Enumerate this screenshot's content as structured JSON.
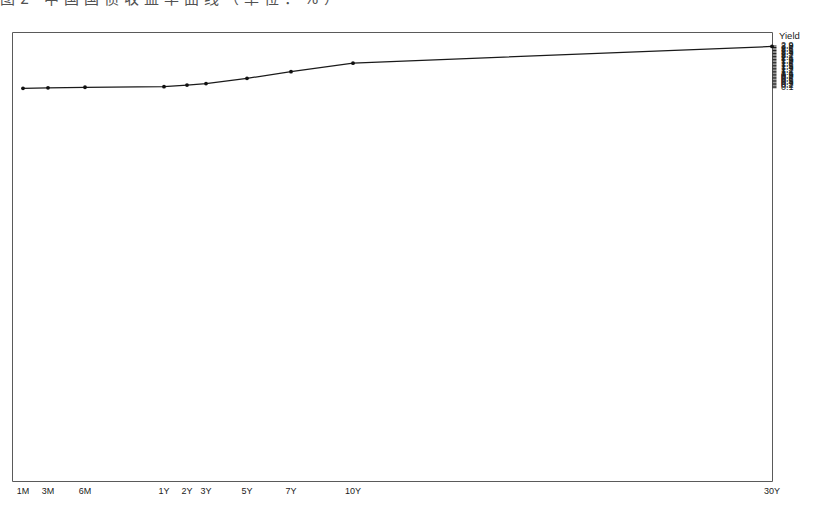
{
  "scan_bleed": {
    "text": "图2·中国国债收益率曲线（单位：%）"
  },
  "chart_data": {
    "type": "line",
    "title": "",
    "xlabel": "",
    "ylabel": "Yield",
    "ylim": [
      0,
      2.95
    ],
    "grid": false,
    "legend": "none",
    "marker": "dot",
    "line_color": "#1a1a1a",
    "categories": [
      "1M",
      "3M",
      "6M",
      "1Y",
      "2Y",
      "3Y",
      "5Y",
      "7Y",
      "10Y",
      "30Y"
    ],
    "x_positions": [
      23,
      48,
      85,
      164,
      187,
      206,
      247,
      291,
      353,
      772
    ],
    "values": [
      0.06,
      0.09,
      0.13,
      0.17,
      0.28,
      0.38,
      0.73,
      1.18,
      1.75,
      2.87
    ],
    "y_ticks": [
      "2.9",
      "2.8",
      "2.7",
      "2.6",
      "2.5",
      "2.4",
      "2.3",
      "2.2",
      "2.1",
      "2",
      "1.9",
      "1.8",
      "1.7",
      "1.6",
      "1.5",
      "1.4",
      "1.3",
      "1.2",
      "1.1",
      "1",
      "0.9",
      "0.8",
      "0.7",
      "0.6",
      "0.5",
      "0.4",
      "0.3",
      "0.2",
      "0.1"
    ],
    "x_tick_labels": [
      "1M",
      "3M",
      "6M",
      "1Y",
      "2Y",
      "3Y",
      "5Y",
      "7Y",
      "10Y",
      "30Y"
    ]
  }
}
